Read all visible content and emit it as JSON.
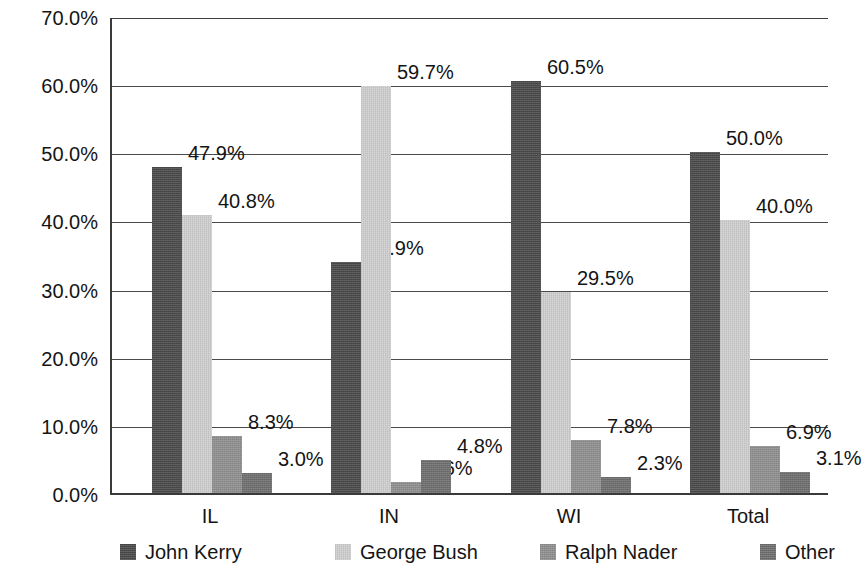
{
  "chart_data": {
    "type": "bar",
    "title": "",
    "subtitle": "",
    "xlabel": "",
    "ylabel": "",
    "categories": [
      "IL",
      "IN",
      "WI",
      "Total"
    ],
    "series": [
      {
        "name": "John Kerry",
        "color": "#4a4a4a",
        "values": [
          47.9,
          33.9,
          60.5,
          50.0
        ],
        "labels": [
          "47.9%",
          "33.9%",
          "60.5%",
          "50.0%"
        ]
      },
      {
        "name": "George Bush",
        "color": "#cfcfcf",
        "values": [
          40.8,
          59.7,
          29.5,
          40.0
        ],
        "labels": [
          "40.8%",
          "59.7%",
          "29.5%",
          "40.0%"
        ]
      },
      {
        "name": "Ralph Nader",
        "color": "#8f8f8f",
        "values": [
          8.3,
          1.6,
          7.8,
          6.9
        ],
        "labels": [
          "8.3%",
          "1.6%",
          "7.8%",
          "6.9%"
        ]
      },
      {
        "name": "Other",
        "color": "#6f6f6f",
        "values": [
          3.0,
          4.8,
          2.3,
          3.1
        ],
        "labels": [
          "3.0%",
          "4.8%",
          "2.3%",
          "3.1%"
        ]
      }
    ],
    "ylim": [
      0,
      70
    ],
    "ytick_step": 10,
    "ytick_labels": [
      "0.0%",
      "10.0%",
      "20.0%",
      "30.0%",
      "40.0%",
      "50.0%",
      "60.0%",
      "70.0%"
    ],
    "ytick_values": [
      0,
      10,
      20,
      30,
      40,
      50,
      60,
      70
    ],
    "grid": "horizontal",
    "legend_position": "bottom",
    "value_labels_shown": true
  },
  "legend": {
    "items": [
      {
        "label": "John Kerry",
        "color": "#4a4a4a"
      },
      {
        "label": "George Bush",
        "color": "#cfcfcf"
      },
      {
        "label": "Ralph Nader",
        "color": "#8f8f8f"
      },
      {
        "label": "Other",
        "color": "#6f6f6f"
      }
    ]
  }
}
